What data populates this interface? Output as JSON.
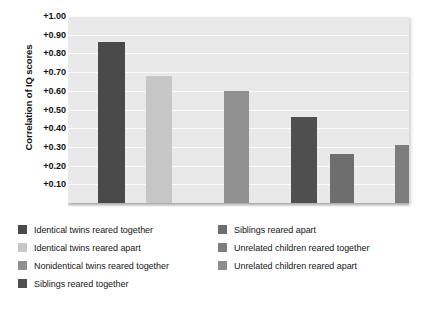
{
  "chart_data": {
    "type": "bar",
    "title": "",
    "xlabel": "",
    "ylabel": "Correlation of IQ scores",
    "ylim": [
      0,
      1.0
    ],
    "grid": true,
    "legend_position": "bottom",
    "tick_labels": [
      "+1.00",
      "+0.90",
      "+0.80",
      "+0.70",
      "+0.60",
      "+0.50",
      "+0.40",
      "+0.30",
      "+0.20",
      "+0.10"
    ],
    "tick_values": [
      1.0,
      0.9,
      0.8,
      0.7,
      0.6,
      0.5,
      0.4,
      0.3,
      0.2,
      0.1
    ],
    "categories": [
      "Identical twins reared together",
      "Identical twins reared apart",
      "Nonidentical twins reared together",
      "Siblings reared together",
      "Siblings reared apart",
      "Unrelated children reared together",
      "Unrelated children reared apart"
    ],
    "values": [
      0.86,
      0.68,
      0.6,
      0.46,
      0.26,
      0.31,
      0.03
    ],
    "colors": [
      "#4a4a4a",
      "#c6c6c6",
      "#909090",
      "#4f4f4f",
      "#6e6e6e",
      "#7d7d7d",
      "#8d8d8d"
    ]
  },
  "plot": {
    "background": "#e9e9e9",
    "gridline_color": "#fbfbfb"
  },
  "legend": {
    "left": [
      {
        "label": "Identical twins reared together",
        "color": "#4a4a4a"
      },
      {
        "label": "Identical twins reared apart",
        "color": "#c6c6c6"
      },
      {
        "label": "Nonidentical twins reared together",
        "color": "#909090"
      },
      {
        "label": "Siblings reared together",
        "color": "#4f4f4f"
      }
    ],
    "right": [
      {
        "label": "Siblings reared apart",
        "color": "#6e6e6e"
      },
      {
        "label": "Unrelated children reared together",
        "color": "#7d7d7d"
      },
      {
        "label": "Unrelated children reared apart",
        "color": "#8d8d8d"
      }
    ]
  }
}
